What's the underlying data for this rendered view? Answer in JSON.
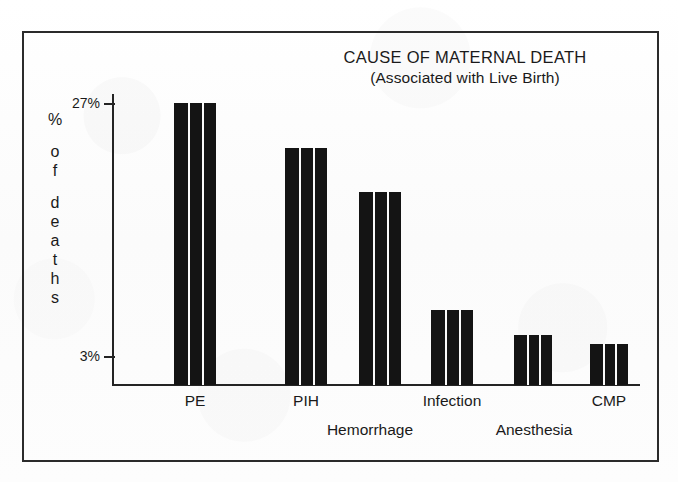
{
  "chart_data": {
    "type": "bar",
    "title": "CAUSE OF MATERNAL DEATH",
    "subtitle": "(Associated with Live Birth)",
    "xlabel": "",
    "ylabel": "% of deaths",
    "ylabel_chars": [
      "%",
      "o",
      "f",
      "d",
      "e",
      "a",
      "t",
      "h",
      "s"
    ],
    "categories": [
      "PE",
      "PIH",
      "Hemorrhage",
      "Infection",
      "Anesthesia",
      "CMP"
    ],
    "values": [
      27,
      22.7,
      18.6,
      7.4,
      5.0,
      4.1
    ],
    "ylim": [
      0,
      29
    ],
    "grid": false,
    "legend": "none",
    "tick_labels": [
      "27%",
      "3%"
    ],
    "tick_values": [
      27,
      3
    ],
    "bar_color": "#141414",
    "axis_color": "#242424",
    "frame_color": "#2b2b2b",
    "background": "#fdfdfd"
  },
  "axis": {
    "ticks": [
      {
        "label": "27%",
        "value": 27
      },
      {
        "label": "3%",
        "value": 3
      }
    ]
  },
  "x_labels": {
    "row_upper": [
      {
        "text": "PE"
      },
      {
        "text": "PIH"
      },
      {
        "text": "Infection"
      },
      {
        "text": "CMP"
      }
    ],
    "row_lower": [
      {
        "text": "Hemorrhage"
      },
      {
        "text": "Anesthesia"
      }
    ]
  },
  "bars": [
    {
      "label": "PE",
      "value": 27
    },
    {
      "label": "PIH",
      "value": 22.7
    },
    {
      "label": "Hemorrhage",
      "value": 18.6
    },
    {
      "label": "Infection",
      "value": 7.4
    },
    {
      "label": "Anesthesia",
      "value": 5.0
    },
    {
      "label": "CMP",
      "value": 4.1
    }
  ]
}
